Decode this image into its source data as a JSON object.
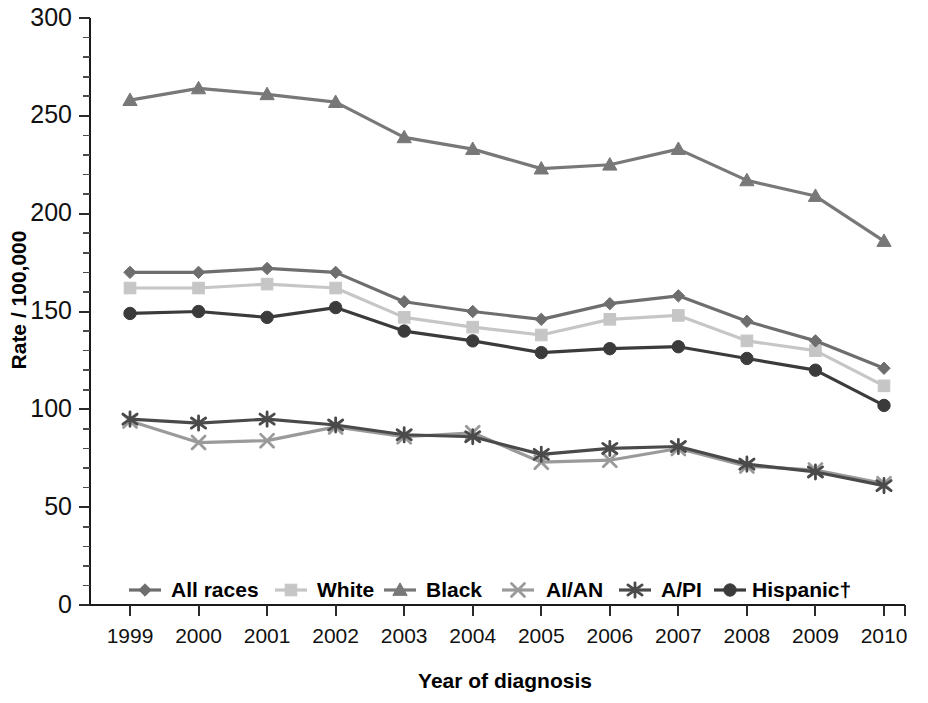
{
  "chart_data": {
    "type": "line",
    "title": "",
    "xlabel": "Year of diagnosis",
    "ylabel": "Rate / 100,000",
    "categories": [
      "1999",
      "2000",
      "2001",
      "2002",
      "2003",
      "2004",
      "2005",
      "2006",
      "2007",
      "2008",
      "2009",
      "2010"
    ],
    "x": [
      1999,
      2000,
      2001,
      2002,
      2003,
      2004,
      2005,
      2006,
      2007,
      2008,
      2009,
      2010
    ],
    "ylim": [
      0,
      300
    ],
    "xlim": [
      1999,
      2010
    ],
    "yticks": [
      0,
      50,
      100,
      150,
      200,
      250,
      300
    ],
    "ytick_labels": [
      "0",
      "50",
      "100",
      "150",
      "200",
      "250",
      "300"
    ],
    "yminor_step": 10,
    "grid": false,
    "legend_position": "inside-bottom-center",
    "series": [
      {
        "name": "All races",
        "marker": "diamond",
        "color": "#6e6e6e",
        "values": [
          170,
          170,
          172,
          170,
          155,
          150,
          146,
          154,
          158,
          145,
          135,
          121
        ]
      },
      {
        "name": "White",
        "marker": "square",
        "color": "#c6c6c6",
        "values": [
          162,
          162,
          164,
          162,
          147,
          142,
          138,
          146,
          148,
          135,
          130,
          112
        ]
      },
      {
        "name": "Black",
        "marker": "triangle",
        "color": "#787878",
        "values": [
          258,
          264,
          261,
          257,
          239,
          233,
          223,
          225,
          233,
          217,
          209,
          186
        ]
      },
      {
        "name": "AI/AN",
        "marker": "cross",
        "color": "#9a9a9a",
        "values": [
          94,
          83,
          84,
          91,
          86,
          88,
          73,
          74,
          80,
          71,
          69,
          62
        ]
      },
      {
        "name": "A/PI",
        "marker": "asterisk",
        "color": "#4a4a4a",
        "values": [
          95,
          93,
          95,
          92,
          87,
          86,
          77,
          80,
          81,
          72,
          68,
          61
        ]
      },
      {
        "name": "Hispanic†",
        "marker": "circle",
        "color": "#3b3b3b",
        "values": [
          149,
          150,
          147,
          152,
          140,
          135,
          129,
          131,
          132,
          126,
          120,
          102
        ]
      }
    ]
  },
  "axes": {
    "y_title": "Rate / 100,000",
    "x_title": "Year of diagnosis"
  },
  "legend": {
    "entries": [
      {
        "label": "All races",
        "marker": "diamond",
        "color": "#6e6e6e"
      },
      {
        "label": "White",
        "marker": "square",
        "color": "#c6c6c6"
      },
      {
        "label": "Black",
        "marker": "triangle",
        "color": "#787878"
      },
      {
        "label": "AI/AN",
        "marker": "cross",
        "color": "#9a9a9a"
      },
      {
        "label": "A/PI",
        "marker": "asterisk",
        "color": "#4a4a4a"
      },
      {
        "label": "Hispanic†",
        "marker": "circle",
        "color": "#3b3b3b"
      }
    ]
  }
}
